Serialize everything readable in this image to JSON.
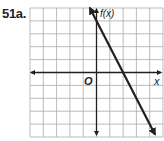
{
  "problem_label": "51a.",
  "chart_data": {
    "type": "line",
    "title": "",
    "xlabel": "x",
    "ylabel": "f(x)",
    "origin_label": "O",
    "xlim": [
      -5,
      5
    ],
    "ylim": [
      -5,
      5
    ],
    "grid": true,
    "grid_step": 1,
    "tick_labels": false,
    "series": [
      {
        "name": "f(x)",
        "equation": "f(x) = -2x + 4",
        "slope": -2,
        "intercept": 4,
        "x_intercept": 2,
        "y_intercept": 4,
        "x": [
          -0.5,
          4.4
        ],
        "y": [
          5,
          -4.8
        ],
        "arrows": "both"
      }
    ],
    "colors": {
      "grid": "#a7a9ac",
      "axis": "#231f20",
      "line": "#231f20"
    }
  }
}
